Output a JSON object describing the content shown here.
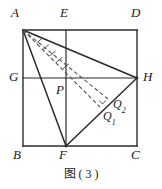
{
  "figure": {
    "caption": "图 ( 3 )",
    "stroke_color": "#2b2b2b",
    "dash_color": "#555555",
    "label_color": "#1a1a1a",
    "background": "#ffffff",
    "width": 162,
    "height": 189
  },
  "labels": {
    "A": "A",
    "E": "E",
    "D": "D",
    "G": "G",
    "H": "H",
    "P": "P",
    "B": "B",
    "F": "F",
    "C": "C",
    "Q1_base": "Q",
    "Q1_sub": "1",
    "Q2_base": "Q",
    "Q2_sub": "2"
  },
  "geometry": {
    "type": "plane-geometry-figure",
    "points": {
      "A": [
        23,
        30
      ],
      "E": [
        66,
        30
      ],
      "D": [
        137,
        30
      ],
      "G": [
        23,
        78
      ],
      "P": [
        66,
        78
      ],
      "H": [
        137,
        78
      ],
      "B": [
        23,
        146
      ],
      "F": [
        66,
        146
      ],
      "C": [
        137,
        146
      ],
      "Q1": [
        100,
        107
      ],
      "Q2": [
        108,
        99
      ]
    },
    "solid_segments": [
      [
        "A",
        "D"
      ],
      [
        "D",
        "C"
      ],
      [
        "C",
        "B"
      ],
      [
        "B",
        "A"
      ],
      [
        "G",
        "H"
      ],
      [
        "E",
        "F"
      ],
      [
        "A",
        "H"
      ],
      [
        "A",
        "F"
      ],
      [
        "F",
        "H"
      ]
    ],
    "dashed_segments": [
      [
        "A",
        "Q1"
      ],
      [
        "A",
        "Q2"
      ]
    ],
    "right_angle_at": "Q2",
    "right_angle_between": [
      "A",
      "H"
    ],
    "tick_marks_on": [
      "A-Q1",
      "A-Q2"
    ],
    "notes": "Rectangle ABCD with midline GH horizontal and EF vertical meeting at P; triangle AFH drawn; dashed cevians from A to points Q1 and Q2 on segment FH."
  }
}
